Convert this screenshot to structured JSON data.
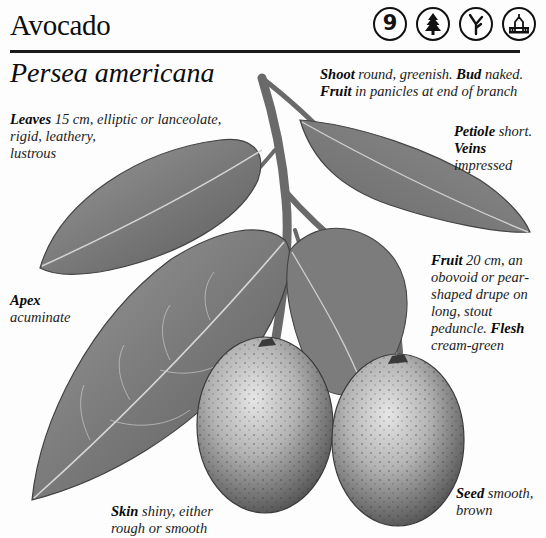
{
  "header": {
    "common_name": "Avocado",
    "scientific_name": "Persea americana",
    "badges": [
      {
        "icon": "zone-number-icon",
        "label": "9"
      },
      {
        "icon": "conifer-tree-icon",
        "label": ""
      },
      {
        "icon": "branch-fork-icon",
        "label": ""
      },
      {
        "icon": "garden-house-icon",
        "label": ""
      }
    ]
  },
  "annotations": {
    "shoot": {
      "term": "Shoot",
      "text": " round, greenish. "
    },
    "bud": {
      "term": "Bud",
      "text": " naked."
    },
    "fruit_panicle": {
      "term": "Fruit",
      "text": " in panicles at end of branch"
    },
    "leaves": {
      "term": "Leaves",
      "line1": " 15 cm, elliptic or lanceolate,",
      "line2": "rigid, leathery,",
      "line3": "lustrous"
    },
    "petiole": {
      "term": "Petiole",
      "text": " short."
    },
    "veins": {
      "term": "Veins",
      "text": "impressed"
    },
    "fruit": {
      "term": "Fruit",
      "line1": " 20 cm, an",
      "line2": "obovoid or pear-",
      "line3": "shaped drupe on",
      "line4": "long, stout",
      "line5": "peduncle. "
    },
    "flesh": {
      "term": "Flesh",
      "text": "cream-green"
    },
    "apex": {
      "term": "Apex",
      "text": "acuminate"
    },
    "skin": {
      "term": "Skin",
      "line1": " shiny, either",
      "line2": "rough or smooth"
    },
    "seed": {
      "term": "Seed",
      "line1": " smooth,",
      "line2": "brown"
    }
  },
  "colors": {
    "ink": "#111111",
    "paper": "#fdfdfd",
    "leaf_dark": "#5a5a5a",
    "leaf_light": "#b9b9b9",
    "fruit_dark": "#4a4a4a",
    "fruit_light": "#d8d8d8"
  }
}
